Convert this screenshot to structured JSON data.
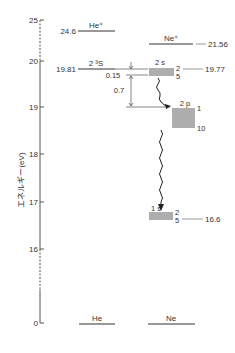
{
  "diagram": {
    "axis": {
      "label": "エネルギー(eV)",
      "ticks": [
        {
          "label": "25",
          "y": 20
        },
        {
          "label": "20",
          "y": 61
        },
        {
          "label": "19",
          "y": 107
        },
        {
          "label": "18",
          "y": 154
        },
        {
          "label": "17",
          "y": 202
        },
        {
          "label": "16",
          "y": 249
        },
        {
          "label": "0",
          "y": 323
        }
      ]
    },
    "he": {
      "ground_label": "He",
      "ion_label": "He⁺",
      "ion_energy": "24.6",
      "metastable_label": "2 ³S",
      "metastable_energy": "19.81"
    },
    "ne": {
      "ground_label": "Ne",
      "ion_label": "Ne⁺",
      "ion_energy": "21.56",
      "s2_label": "2 s",
      "s2_top": "2",
      "s2_bottom": "5",
      "s2_energy": "19.77",
      "p2_label": "2 p",
      "p2_top": "1",
      "p2_bottom": "10",
      "s1_label": "1 s",
      "s1_top": "2",
      "s1_bottom": "5",
      "s1_energy": "16.6"
    },
    "gaps": {
      "small": "0.15",
      "large": "0.7"
    }
  }
}
